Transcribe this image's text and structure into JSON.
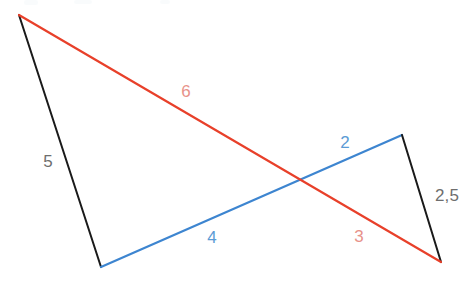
{
  "diagram": {
    "type": "geometric-line-diagram",
    "canvas": {
      "width": 475,
      "height": 292,
      "background": "#ffffff"
    },
    "colors": {
      "black_line": "#1a1a1a",
      "blue_line": "#3d85d0",
      "red_line": "#e8402a",
      "black_label": "#6e6e6e",
      "blue_label": "#5b9bd5",
      "red_label": "#e8928a"
    },
    "vertices": [
      {
        "id": "A",
        "x": 19,
        "y": 15,
        "role": "top-left-apex"
      },
      {
        "id": "B",
        "x": 101,
        "y": 267,
        "role": "bottom-left"
      },
      {
        "id": "C",
        "x": 402,
        "y": 135,
        "role": "right-peak"
      },
      {
        "id": "D",
        "x": 441,
        "y": 262,
        "role": "bottom-right"
      }
    ],
    "intersection": {
      "x": 297,
      "y": 180
    },
    "segments": [
      {
        "id": "left-black-segment",
        "color": "black",
        "from": "A",
        "to": "B",
        "x1": 19,
        "y1": 15,
        "x2": 101,
        "y2": 267
      },
      {
        "id": "blue-segment",
        "color": "blue",
        "from": "B",
        "to": "C",
        "x1": 101,
        "y1": 267,
        "x2": 402,
        "y2": 135
      },
      {
        "id": "right-black-segment",
        "color": "black",
        "from": "C",
        "to": "D",
        "x1": 402,
        "y1": 135,
        "x2": 441,
        "y2": 262
      },
      {
        "id": "red-segment",
        "color": "red",
        "from": "A",
        "to": "D",
        "x1": 19,
        "y1": 15,
        "x2": 441,
        "y2": 262
      }
    ],
    "labels": [
      {
        "id": "label-5",
        "text": "5",
        "x": 48,
        "y": 163,
        "color": "black",
        "segment": "left-black-segment"
      },
      {
        "id": "label-6",
        "text": "6",
        "x": 186,
        "y": 93,
        "color": "red",
        "segment": "red-segment"
      },
      {
        "id": "label-2",
        "text": "2",
        "x": 345,
        "y": 144,
        "color": "blue",
        "segment": "blue-segment"
      },
      {
        "id": "label-4",
        "text": "4",
        "x": 212,
        "y": 239,
        "color": "blue",
        "segment": "blue-segment"
      },
      {
        "id": "label-3",
        "text": "3",
        "x": 359,
        "y": 238,
        "color": "red",
        "segment": "red-segment"
      },
      {
        "id": "label-2-5",
        "text": "2,5",
        "x": 447,
        "y": 197,
        "color": "black",
        "segment": "right-black-segment"
      }
    ]
  }
}
